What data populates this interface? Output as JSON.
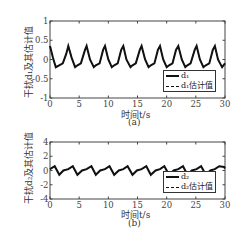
{
  "figure": {
    "panel_a": {
      "ylabel": "干扰d₁及其估计值",
      "xlabel": "时间t/s",
      "caption": "(a)",
      "legend": [
        "d₁",
        "d₁估计值"
      ],
      "yticks": [
        "1",
        "0.5",
        "0",
        "-0.5",
        "-1"
      ],
      "xticks": [
        "0",
        "5",
        "10",
        "15",
        "20",
        "25",
        "30"
      ]
    },
    "panel_b": {
      "ylabel": "干扰d₂及其估计值",
      "xlabel": "时间t/s",
      "caption": "(b)",
      "legend": [
        "d₂",
        "d₂估计值"
      ],
      "yticks": [
        "4",
        "2",
        "0",
        "-2",
        "-4"
      ],
      "xticks": [
        "0",
        "5",
        "10",
        "15",
        "20",
        "25",
        "30"
      ]
    }
  },
  "chart_data": [
    {
      "type": "line",
      "title": "(a)",
      "xlabel": "时间t/s",
      "ylabel": "干扰d₁及其估计值",
      "xlim": [
        0,
        30
      ],
      "ylim": [
        -1,
        1
      ],
      "xticks": [
        0,
        5,
        10,
        15,
        20,
        25,
        30
      ],
      "yticks": [
        -1,
        -0.5,
        0,
        0.5,
        1
      ],
      "grid": false,
      "legend_position": "lower right",
      "series": [
        {
          "name": "d₁",
          "style": "solid",
          "description": "periodic pulse-like signal, period ~3.14 s, peaks ~0.35, troughs ~-0.2",
          "x": [
            0,
            0.5,
            1.0,
            1.57,
            2.2,
            2.8,
            3.14,
            3.7,
            4.3,
            4.71,
            5.3,
            6.0,
            6.28,
            6.85,
            7.5,
            7.85,
            8.5,
            9.1,
            9.42,
            10.0,
            10.6,
            11.0,
            11.6,
            12.2,
            12.57,
            13.1,
            13.8,
            14.14,
            14.7,
            15.4,
            15.71,
            16.3,
            16.9,
            17.28,
            17.9,
            18.5,
            18.85,
            19.4,
            20.0,
            20.42,
            21.0,
            21.6,
            21.99,
            22.6,
            23.2,
            23.56,
            24.1,
            24.8,
            25.13,
            25.7,
            26.3,
            26.7,
            27.3,
            27.9,
            28.27,
            28.8,
            29.5,
            30
          ],
          "y": [
            0.35,
            0.05,
            -0.2,
            -0.15,
            -0.1,
            0.15,
            0.35,
            0.05,
            -0.2,
            -0.15,
            -0.1,
            0.25,
            0.35,
            0.0,
            -0.2,
            -0.15,
            -0.1,
            0.25,
            0.35,
            0.0,
            -0.2,
            -0.15,
            -0.1,
            0.25,
            0.35,
            0.0,
            -0.2,
            -0.15,
            -0.1,
            0.25,
            0.35,
            0.0,
            -0.2,
            -0.15,
            -0.1,
            0.25,
            0.35,
            0.0,
            -0.2,
            -0.15,
            -0.1,
            0.25,
            0.35,
            0.0,
            -0.2,
            -0.15,
            -0.1,
            0.25,
            0.35,
            0.0,
            -0.2,
            -0.15,
            -0.1,
            0.25,
            0.35,
            0.0,
            -0.2,
            -0.1
          ]
        },
        {
          "name": "d₁估计值",
          "style": "dashed",
          "description": "overlaps d₁"
        }
      ]
    },
    {
      "type": "line",
      "title": "(b)",
      "xlabel": "时间t/s",
      "ylabel": "干扰d₂及其估计值",
      "xlim": [
        0,
        30
      ],
      "ylim": [
        -4,
        4
      ],
      "xticks": [
        0,
        5,
        10,
        15,
        20,
        25,
        30
      ],
      "yticks": [
        -4,
        -2,
        0,
        2,
        4
      ],
      "grid": false,
      "legend_position": "lower right",
      "series": [
        {
          "name": "d₂",
          "style": "solid",
          "description": "sawtooth-like periodic signal, period ~3.14 s, range ~-0.6 to 0.6",
          "x": [
            0,
            0.8,
            1.6,
            2.3,
            3.14,
            3.9,
            4.7,
            5.5,
            6.28,
            7.1,
            7.85,
            8.6,
            9.42,
            10.2,
            11.0,
            11.8,
            12.57,
            13.3,
            14.14,
            14.9,
            15.71,
            16.5,
            17.28,
            18.1,
            18.85,
            19.6,
            20.42,
            21.2,
            21.99,
            22.8,
            23.56,
            24.3,
            25.13,
            25.9,
            26.7,
            27.5,
            28.27,
            29.0,
            29.84,
            30
          ],
          "y": [
            0.2,
            0.6,
            -0.6,
            0.0,
            0.2,
            0.6,
            -0.6,
            0.0,
            0.2,
            0.6,
            -0.6,
            0.0,
            0.2,
            0.6,
            -0.6,
            0.0,
            0.2,
            0.6,
            -0.6,
            0.0,
            0.2,
            0.6,
            -0.6,
            0.0,
            0.2,
            0.6,
            -0.6,
            0.0,
            0.2,
            0.6,
            -0.6,
            0.0,
            0.2,
            0.6,
            -0.6,
            0.0,
            0.2,
            0.6,
            0.5,
            0.3
          ]
        },
        {
          "name": "d₂估计值",
          "style": "dashed",
          "description": "overlaps d₂"
        }
      ]
    }
  ]
}
